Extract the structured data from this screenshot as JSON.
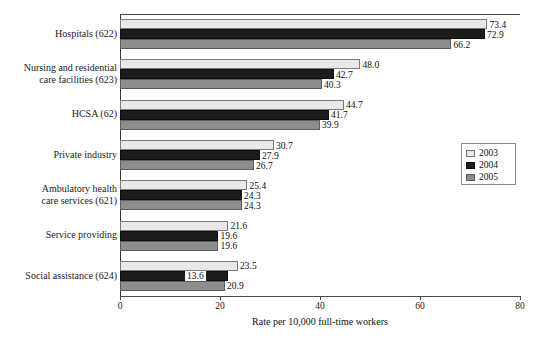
{
  "chart_data": {
    "type": "bar",
    "orientation": "horizontal",
    "title": "",
    "xlabel": "Rate per 10,000 full-time workers",
    "ylabel": "",
    "xlim": [
      0,
      80
    ],
    "xticks": [
      0,
      20,
      40,
      60,
      80
    ],
    "grid": false,
    "legend_position": "right-middle",
    "categories": [
      "Hospitals (622)",
      "Nursing and residential care facilities (623)",
      "HCSA (62)",
      "Private industry",
      "Ambulatory health care services (621)",
      "Service providing",
      "Social assistance (624)"
    ],
    "series": [
      {
        "name": "2003",
        "color": "#e9e9e9",
        "values": [
          73.4,
          48.0,
          44.7,
          30.7,
          25.4,
          21.6,
          23.5
        ]
      },
      {
        "name": "2004",
        "color": "#1c1c1c",
        "values": [
          72.9,
          42.7,
          41.7,
          27.9,
          24.3,
          19.6,
          13.6
        ]
      },
      {
        "name": "2005",
        "color": "#8d8d8d",
        "values": [
          66.2,
          40.3,
          39.9,
          26.7,
          24.3,
          19.6,
          20.9
        ]
      }
    ]
  },
  "axis": {
    "tick_labels": [
      "0",
      "20",
      "40",
      "60",
      "80"
    ],
    "x_title": "Rate per 10,000 full-time workers"
  },
  "categories_display": [
    {
      "lines": [
        "Hospitals (622)"
      ]
    },
    {
      "lines": [
        "Nursing and residential",
        "care facilities (623)"
      ]
    },
    {
      "lines": [
        "HCSA (62)"
      ]
    },
    {
      "lines": [
        "Private industry"
      ]
    },
    {
      "lines": [
        "Ambulatory health",
        "care services (621)"
      ]
    },
    {
      "lines": [
        "Service providing"
      ]
    },
    {
      "lines": [
        "Social assistance (624)"
      ]
    }
  ],
  "legend": {
    "items": [
      {
        "label": "2003",
        "swatch": "y2003"
      },
      {
        "label": "2004",
        "swatch": "y2004"
      },
      {
        "label": "2005",
        "swatch": "y2005"
      }
    ]
  },
  "value_labels": [
    [
      "73.4",
      "72.9",
      "66.2"
    ],
    [
      "48.0",
      "42.7",
      "40.3"
    ],
    [
      "44.7",
      "41.7",
      "39.9"
    ],
    [
      "30.7",
      "27.9",
      "26.7"
    ],
    [
      "25.4",
      "24.3",
      "24.3"
    ],
    [
      "21.6",
      "19.6",
      "19.6"
    ],
    [
      "23.5",
      "13.6",
      "20.9"
    ]
  ],
  "colors": {
    "series_2003": "#e9e9e9",
    "series_2004": "#1c1c1c",
    "series_2005": "#8d8d8d",
    "axis": "#4a4a4a",
    "text": "#111111",
    "background": "#ffffff"
  }
}
